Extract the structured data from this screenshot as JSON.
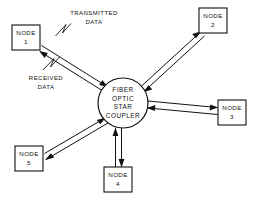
{
  "diagram": {
    "type": "star-topology-network-diagram",
    "canvas": {
      "width": 256,
      "height": 202
    },
    "colors": {
      "background": "#ffffff",
      "stroke": "#111111",
      "fill": "#ffffff"
    }
  },
  "hub": {
    "name": "fiber-optic-star-coupler",
    "shape": "circle",
    "center": {
      "x": 123,
      "y": 103
    },
    "radius": 25,
    "lines": [
      "FIBER",
      "OPTIC",
      "STAR",
      "COUPLER"
    ]
  },
  "nodes": [
    {
      "id": "node-1",
      "line1": "NODE",
      "line2": "1",
      "box": {
        "x": 12,
        "y": 25,
        "w": 28,
        "h": 25
      }
    },
    {
      "id": "node-2",
      "line1": "NODE",
      "line2": "2",
      "box": {
        "x": 199,
        "y": 8,
        "w": 28,
        "h": 25
      }
    },
    {
      "id": "node-3",
      "line1": "NODE",
      "line2": "3",
      "box": {
        "x": 218,
        "y": 100,
        "w": 28,
        "h": 25
      }
    },
    {
      "id": "node-4",
      "line1": "NODE",
      "line2": "4",
      "box": {
        "x": 104,
        "y": 167,
        "w": 28,
        "h": 25
      }
    },
    {
      "id": "node-5",
      "line1": "NODE",
      "line2": "5",
      "box": {
        "x": 15,
        "y": 146,
        "w": 28,
        "h": 25
      }
    }
  ],
  "annotations": [
    {
      "id": "transmitted-data-label",
      "line1": "TRANSMITTED",
      "line2": "DATA",
      "position": {
        "x": 94,
        "y": 13
      }
    },
    {
      "id": "received-data-label",
      "line1": "RECEIVED",
      "line2": "DATA",
      "position": {
        "x": 46,
        "y": 78
      }
    }
  ],
  "links": [
    {
      "id": "link-node-1",
      "from": "node-1",
      "to": "hub",
      "bidirectional": true
    },
    {
      "id": "link-node-2",
      "from": "node-2",
      "to": "hub",
      "bidirectional": true
    },
    {
      "id": "link-node-3",
      "from": "node-3",
      "to": "hub",
      "bidirectional": true
    },
    {
      "id": "link-node-4",
      "from": "node-4",
      "to": "hub",
      "bidirectional": true
    },
    {
      "id": "link-node-5",
      "from": "node-5",
      "to": "hub",
      "bidirectional": true
    }
  ]
}
